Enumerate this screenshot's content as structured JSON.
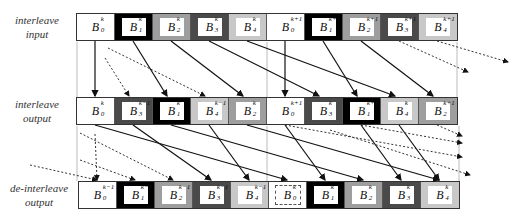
{
  "labels": {
    "input": [
      "interleave",
      "input"
    ],
    "output": [
      "interleave",
      "output"
    ],
    "deinterleave": [
      "de-interleave",
      "output"
    ]
  },
  "rows": {
    "interleave_input": [
      {
        "sym": "B",
        "sub": "0",
        "sup": "k",
        "shade": "c0"
      },
      {
        "sym": "B",
        "sub": "1",
        "sup": "k",
        "shade": "c1"
      },
      {
        "sym": "B",
        "sub": "2",
        "sup": "k",
        "shade": "c2"
      },
      {
        "sym": "B",
        "sub": "3",
        "sup": "k",
        "shade": "c3"
      },
      {
        "sym": "B",
        "sub": "4",
        "sup": "k",
        "shade": "c4"
      },
      {
        "sym": "B",
        "sub": "0",
        "sup": "k+1",
        "shade": "c0"
      },
      {
        "sym": "B",
        "sub": "1",
        "sup": "k+1",
        "shade": "c1"
      },
      {
        "sym": "B",
        "sub": "2",
        "sup": "k+1",
        "shade": "c2"
      },
      {
        "sym": "B",
        "sub": "3",
        "sup": "k+1",
        "shade": "c3"
      },
      {
        "sym": "B",
        "sub": "4",
        "sup": "k+1",
        "shade": "c4"
      }
    ],
    "interleave_output": [
      {
        "sym": "B",
        "sub": "0",
        "sup": "k",
        "shade": "c0"
      },
      {
        "sym": "B",
        "sub": "3",
        "sup": "k−1",
        "shade": "c3"
      },
      {
        "sym": "B",
        "sub": "1",
        "sup": "k",
        "shade": "c1"
      },
      {
        "sym": "B",
        "sub": "4",
        "sup": "k−1",
        "shade": "c4"
      },
      {
        "sym": "B",
        "sub": "2",
        "sup": "k",
        "shade": "c2"
      },
      {
        "sym": "B",
        "sub": "0",
        "sup": "k+1",
        "shade": "c0"
      },
      {
        "sym": "B",
        "sub": "3",
        "sup": "k",
        "shade": "c3"
      },
      {
        "sym": "B",
        "sub": "1",
        "sup": "k+1",
        "shade": "c1"
      },
      {
        "sym": "B",
        "sub": "4",
        "sup": "k",
        "shade": "c4"
      },
      {
        "sym": "B",
        "sub": "2",
        "sup": "k+1",
        "shade": "c2"
      }
    ],
    "deinterleave_output": [
      {
        "sym": "B",
        "sub": "0",
        "sup": "k−1",
        "shade": "c0"
      },
      {
        "sym": "B",
        "sub": "1",
        "sup": "k−1",
        "shade": "c1"
      },
      {
        "sym": "B",
        "sub": "2",
        "sup": "k−1",
        "shade": "c2"
      },
      {
        "sym": "B",
        "sub": "3",
        "sup": "k−1",
        "shade": "c3"
      },
      {
        "sym": "B",
        "sub": "4",
        "sup": "k−1",
        "shade": "c4"
      },
      {
        "sym": "B",
        "sub": "0",
        "sup": "k",
        "shade": "c0",
        "dotted": true
      },
      {
        "sym": "B",
        "sub": "1",
        "sup": "k",
        "shade": "c1"
      },
      {
        "sym": "B",
        "sub": "2",
        "sup": "k",
        "shade": "c2"
      },
      {
        "sym": "B",
        "sub": "3",
        "sup": "k",
        "shade": "c3"
      },
      {
        "sym": "B",
        "sub": "4",
        "sup": "k",
        "shade": "c4"
      }
    ]
  },
  "colors": {
    "c0": "#ffffff",
    "c1": "#000000",
    "c2": "#9e9e9e",
    "c3": "#4a4a4a",
    "c4": "#c8c8c8"
  }
}
